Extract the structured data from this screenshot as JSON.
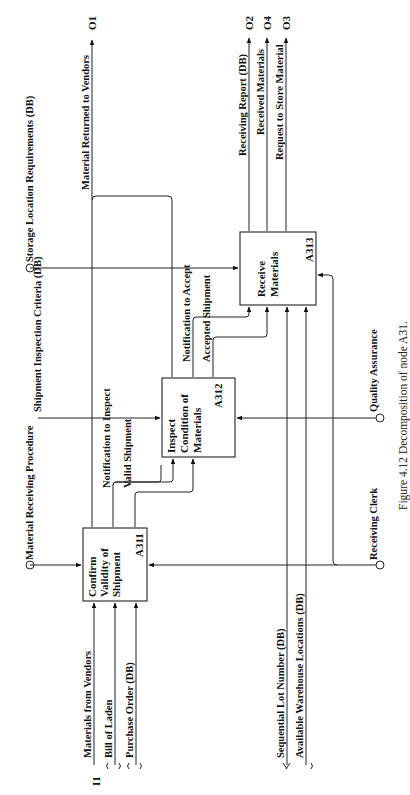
{
  "figure": {
    "caption": "Figure 4.12    Decomposition of node A31.",
    "orientation": "rotated-90-ccw"
  },
  "boxes": [
    {
      "id": "A311",
      "label_lines": [
        "Confirm",
        "Validity of",
        "Shipment"
      ],
      "node": "A311"
    },
    {
      "id": "A312",
      "label_lines": [
        "Inspect",
        "Condition of",
        "Materials"
      ],
      "node": "A312"
    },
    {
      "id": "A313",
      "label_lines": [
        "Receive",
        "Materials"
      ],
      "node": "A313"
    }
  ],
  "inputs": {
    "port": "I1",
    "items": [
      "Materials from Vendors",
      "Bill of Laden",
      "Purchase Order (DB)"
    ]
  },
  "controls": {
    "material_receiving_procedure": "Material Receiving Procedure",
    "shipment_inspection_criteria": "Shipment Inspection Criteria (DB)",
    "storage_location_requirements": "Storage Location Requirements (DB)"
  },
  "internal_arrows": {
    "notification_to_inspect": "Notification to Inspect",
    "valid_shipment": "Valid Shipment",
    "notification_to_accept": "Notification to Accept",
    "accepted_shipment": "Accepted Shipment"
  },
  "mechanisms": {
    "sequential_lot_number": "Sequential Lot Number (DB)",
    "available_warehouse_locations": "Available Warehouse Locations (DB)",
    "receiving_clerk": "Receiving Clerk",
    "quality_assurance": "Quality Assurance"
  },
  "outputs": [
    {
      "port": "O1",
      "label": "Material Returned to Vendors"
    },
    {
      "port": "O2",
      "label": "Receiving Report (DB)"
    },
    {
      "port": "O4",
      "label": "Received Materials"
    },
    {
      "port": "O3",
      "label": "Request to Store Material"
    }
  ]
}
